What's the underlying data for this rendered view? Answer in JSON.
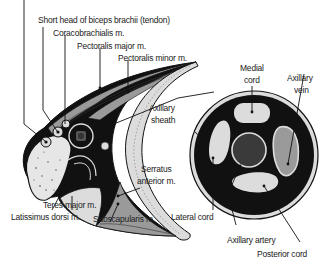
{
  "diagram": {
    "type": "anatomical-cross-section",
    "left_panel": {
      "labels": {
        "biceps": "Short head of biceps brachii (tendon)",
        "coracobrachialis": "Coracobrachialis m.",
        "pect_major": "Pectoralis major m.",
        "pect_minor": "Pectoralis minor m.",
        "axillary_sheath_1": "Axillary",
        "axillary_sheath_2": "sheath",
        "serratus_1": "Serratus",
        "serratus_2": "anterior m.",
        "teres_major": "Teres major m.",
        "latissimus": "Latissimus dorsi m.",
        "subscapularis": "Subscapularis m."
      }
    },
    "right_panel": {
      "labels": {
        "medial_1": "Medial",
        "medial_2": "cord",
        "vein_1": "Axillary",
        "vein_2": "vein",
        "lateral": "Lateral cord",
        "artery": "Axillary artery",
        "posterior": "Posterior cord"
      }
    },
    "colors": {
      "ink": "#111111",
      "light_gray": "#dcdcdc",
      "mid_gray": "#9a9a9a",
      "dark_gray": "#555555",
      "label": "#222222"
    }
  }
}
